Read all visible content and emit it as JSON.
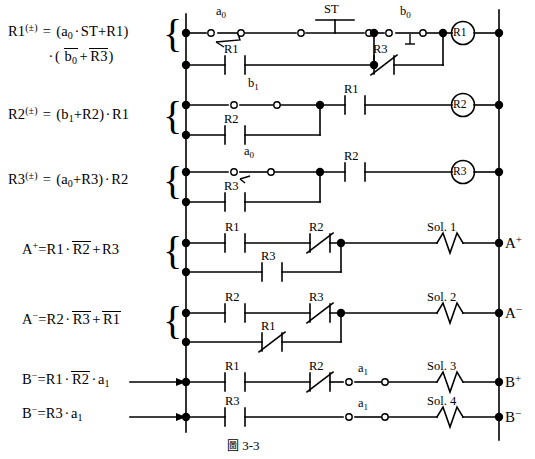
{
  "figure": {
    "caption_cjk": "圖",
    "caption_number": "3-3"
  },
  "equations": [
    {
      "id": "eq-r1",
      "text": "R1(±) = (a0 · ST + R1) · ( b0‾ + R3‾ )"
    },
    {
      "id": "eq-r2",
      "text": "R2(±) = (b1 + R2) · R1"
    },
    {
      "id": "eq-r3",
      "text": "R3(±) = (a0 + R3) · R2"
    },
    {
      "id": "eq-ap",
      "text": "A+ = R1 · R2‾ + R3"
    },
    {
      "id": "eq-am",
      "text": "A− = R2 · R3‾ + R1‾"
    },
    {
      "id": "eq-bp",
      "text": "B+ = R1 · R2‾ · a1"
    },
    {
      "id": "eq-bm",
      "text": "B− = R3 · a1"
    }
  ],
  "eq_parts": {
    "r1_lhs": "R1",
    "r1_pm": "(±)",
    "r1_eq": "=",
    "r1_line1_a": "(",
    "r1_a0": "a",
    "r1_a0_sub": "0",
    "r1_dot1": "·",
    "r1_st": "ST",
    "r1_plus": "+",
    "r1_r1": "R1",
    "r1_close1": ")",
    "r1_dot2": "·",
    "r1_open2": "(",
    "r1_b0": "b",
    "r1_b0_sub": "0",
    "r1_plus2": "+",
    "r1_r3": "R3",
    "r1_close2": ")",
    "r2_lhs": "R2",
    "r2_pm": "(±)",
    "r2_eq": "=",
    "r2_open": "(",
    "r2_b1": "b",
    "r2_b1_sub": "1",
    "r2_plus": "+",
    "r2_r2": "R2",
    "r2_close": ")",
    "r2_dot": "·",
    "r2_r1": "R1",
    "r3_lhs": "R3",
    "r3_pm": "(±)",
    "r3_eq": "=",
    "r3_open": "(",
    "r3_a0": "a",
    "r3_a0_sub": "0",
    "r3_plus": "+",
    "r3_r3": "R3",
    "r3_close": ")",
    "r3_dot": "·",
    "r3_r2": "R2",
    "ap_lhs": "A",
    "ap_sup": "+",
    "ap_eq": "=",
    "ap_r1": "R1",
    "ap_dot": "·",
    "ap_r2": "R2",
    "ap_plus": "+",
    "ap_r3": "R3",
    "am_lhs": "A",
    "am_sup": "−",
    "am_eq": "=",
    "am_r2": "R2",
    "am_dot": "·",
    "am_r3": "R3",
    "am_plus": "+",
    "am_r1": "R1",
    "bp_lhs": "B",
    "bp_sup": "−",
    "bp_eq": "=",
    "bp_r1": "R1",
    "bp_dot1": "·",
    "bp_r2": "R2",
    "bp_dot2": "·",
    "bp_a1": "a",
    "bp_a1_sub": "1",
    "bm_lhs": "B",
    "bm_sup": "−",
    "bm_eq": "=",
    "bm_r3": "R3",
    "bm_dot": "·",
    "bm_a1": "a",
    "bm_a1_sub": "1"
  },
  "rungs": [
    {
      "name": "rung-r1",
      "coil": "R1",
      "terminal": null,
      "top_labels": [
        "a0",
        "ST",
        "b0"
      ],
      "bottom_labels": [
        "R1",
        "R3"
      ]
    },
    {
      "name": "rung-r2",
      "coil": "R2",
      "terminal": null,
      "top_labels": [
        "b1",
        "R1"
      ],
      "bottom_labels": [
        "R2"
      ]
    },
    {
      "name": "rung-r3",
      "coil": "R3",
      "terminal": null,
      "top_labels": [
        "a0",
        "R2"
      ],
      "bottom_labels": [
        "R3"
      ]
    },
    {
      "name": "rung-sol1",
      "coil": "Sol. 1",
      "terminal": "A+",
      "top_labels": [
        "R1",
        "R2"
      ],
      "bottom_labels": [
        "R3"
      ]
    },
    {
      "name": "rung-sol2",
      "coil": "Sol. 2",
      "terminal": "A−",
      "top_labels": [
        "R2",
        "R3"
      ],
      "bottom_labels": [
        "R1"
      ]
    },
    {
      "name": "rung-sol3",
      "coil": "Sol. 3",
      "terminal": "B+",
      "top_labels": [
        "R1",
        "R2",
        "a1"
      ],
      "bottom_labels": []
    },
    {
      "name": "rung-sol4",
      "coil": "Sol. 4",
      "terminal": "B−",
      "top_labels": [
        "R3",
        "a1"
      ],
      "bottom_labels": []
    }
  ],
  "labels": {
    "a0_1": "a",
    "a0_1_sub": "0",
    "st": "ST",
    "b0": "b",
    "b0_sub": "0",
    "r1_c1": "R1",
    "r3_c1": "R3",
    "coil_r1": "R1",
    "b1": "b",
    "b1_sub": "1",
    "r1_c2": "R1",
    "r2_c2": "R2",
    "coil_r2": "R2",
    "a0_2": "a",
    "a0_2_sub": "0",
    "r2_c3": "R2",
    "r3_c3": "R3",
    "coil_r3": "R3",
    "r1_c4": "R1",
    "r2_c4": "R2",
    "r3_c4": "R3",
    "sol1": "Sol. 1",
    "term_a_plus": "A",
    "term_a_plus_sup": "+",
    "r2_c5": "R2",
    "r3_c5": "R3",
    "r1_c5": "R1",
    "sol2": "Sol. 2",
    "term_a_minus": "A",
    "term_a_minus_sup": "−",
    "r1_c6": "R1",
    "r2_c6": "R2",
    "a1_6": "a",
    "a1_6_sub": "1",
    "sol3": "Sol. 3",
    "term_b_plus": "B",
    "term_b_plus_sup": "+",
    "r3_c7": "R3",
    "a1_7": "a",
    "a1_7_sub": "1",
    "sol4": "Sol. 4",
    "term_b_minus": "B",
    "term_b_minus_sup": "−"
  },
  "braces": {
    "b1": "{",
    "b2": "{",
    "b3": "{",
    "b4": "{",
    "b5": "{"
  },
  "colors": {
    "ink": "#000000",
    "background": "#ffffff"
  }
}
